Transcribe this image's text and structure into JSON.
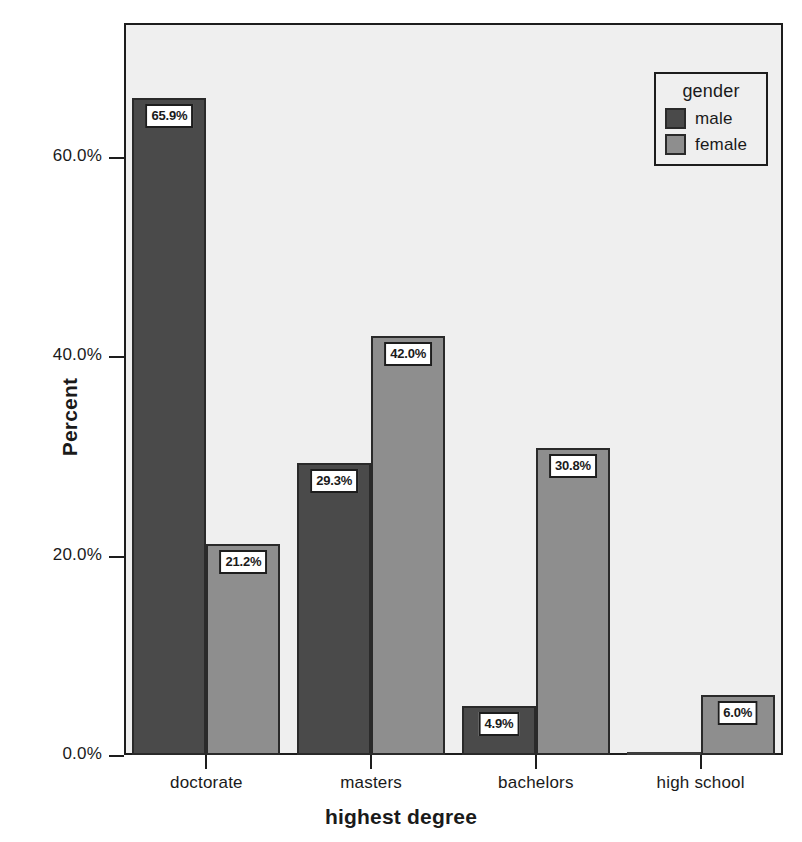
{
  "chart_data": {
    "type": "bar",
    "title": "",
    "xlabel": "highest degree",
    "ylabel": "Percent",
    "categories": [
      "doctorate",
      "masters",
      "bachelors",
      "high school"
    ],
    "series": [
      {
        "name": "male",
        "color": "#4a4a4a",
        "values": [
          65.9,
          29.3,
          4.9,
          0.0
        ],
        "labels": [
          "65.9%",
          "29.3%",
          "4.9%",
          ""
        ]
      },
      {
        "name": "female",
        "color": "#8e8e8e",
        "values": [
          21.2,
          42.0,
          30.8,
          6.0
        ],
        "labels": [
          "21.2%",
          "42.0%",
          "30.8%",
          "6.0%"
        ]
      }
    ],
    "ylim": [
      0,
      73.4
    ],
    "yticks": [
      0,
      20,
      40,
      60
    ],
    "ytick_labels": [
      "0.0%",
      "20.0%",
      "40.0%",
      "60.0%"
    ],
    "grid": false,
    "legend": {
      "title": "gender",
      "position": "top-right-inside",
      "entries": [
        "male",
        "female"
      ]
    },
    "plot_background": "#efefef",
    "page_background": "#ffffff"
  },
  "axes": {
    "y_title": "Percent",
    "x_title": "highest degree"
  },
  "legend": {
    "title": "gender",
    "items": [
      {
        "label": "male"
      },
      {
        "label": "female"
      }
    ]
  }
}
